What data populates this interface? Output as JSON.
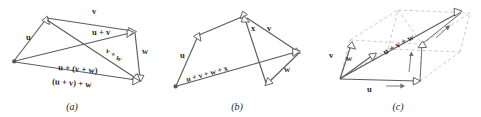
{
  "figure": {
    "background_color": "#ffffff",
    "line_color": "#5c5c63",
    "dashed_color": "#bdbdc4",
    "label_color": "#2b2b2b"
  },
  "panels": [
    {
      "id": "a",
      "caption": "(a)",
      "description": "associativity-of-vector-addition-planar",
      "labels": {
        "u": "u",
        "v": "v",
        "w": "w",
        "u_plus_v": "u + v",
        "v_plus_w": "v + w",
        "u_plus_v_plus_w_left": "u + (v + w)",
        "u_plus_v_plus_w_right": "(u + v) + w"
      }
    },
    {
      "id": "b",
      "caption": "(b)",
      "description": "sum-of-four-vectors-polygon",
      "labels": {
        "u": "u",
        "v": "v",
        "w": "w",
        "x": "x",
        "sum": "u + v + w + x"
      }
    },
    {
      "id": "c",
      "caption": "(c)",
      "description": "parallelepiped-sum-of-three-vectors",
      "labels": {
        "u": "u",
        "v": "v",
        "w": "w",
        "sum": "u + v + w"
      }
    }
  ]
}
